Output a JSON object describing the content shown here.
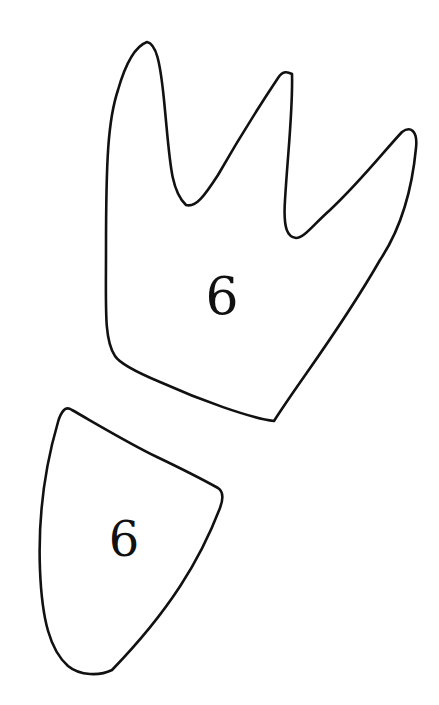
{
  "canvas": {
    "width": 439,
    "height": 705,
    "background": "#ffffff",
    "stroke_color": "#111111"
  },
  "shapes": [
    {
      "name": "crown-shape",
      "label": "6",
      "label_x": 222,
      "label_y": 314,
      "label_size": 52
    },
    {
      "name": "shield-shape",
      "label": "6",
      "label_x": 124,
      "label_y": 556,
      "label_size": 48
    }
  ]
}
